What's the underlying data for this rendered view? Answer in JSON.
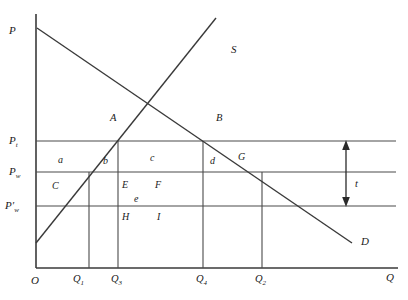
{
  "figure": {
    "type": "economics-tariff-diagram",
    "axes": {
      "y_axis_label": "P",
      "x_axis_label": "Q",
      "origin_label": "O"
    },
    "curves": [
      {
        "name": "demand",
        "label": "D"
      },
      {
        "name": "supply",
        "label": "S"
      }
    ],
    "price_levels": [
      {
        "id": "pt",
        "base": "P",
        "sub": "t",
        "prime": false
      },
      {
        "id": "pw",
        "base": "P",
        "sub": "w",
        "prime": false
      },
      {
        "id": "pwp",
        "base": "P",
        "sub": "w",
        "prime": true
      }
    ],
    "quantities": [
      {
        "id": "q1",
        "base": "Q",
        "sub": "1"
      },
      {
        "id": "q3",
        "base": "Q",
        "sub": "3"
      },
      {
        "id": "q4",
        "base": "Q",
        "sub": "4"
      },
      {
        "id": "q2",
        "base": "Q",
        "sub": "2"
      }
    ],
    "points": [
      {
        "id": "a",
        "label": "A"
      },
      {
        "id": "b",
        "label": "B"
      }
    ],
    "regions": [
      {
        "id": "a_low",
        "label": "a"
      },
      {
        "id": "b_low",
        "label": "b"
      },
      {
        "id": "c_low",
        "label": "c"
      },
      {
        "id": "d_low",
        "label": "d"
      },
      {
        "id": "g_up",
        "label": "G"
      },
      {
        "id": "c_up",
        "label": "C"
      },
      {
        "id": "e_up",
        "label": "E"
      },
      {
        "id": "f_up",
        "label": "F"
      },
      {
        "id": "e_low",
        "label": "e"
      },
      {
        "id": "h_up",
        "label": "H"
      },
      {
        "id": "i_up",
        "label": "I"
      }
    ],
    "annotations": [
      {
        "id": "tariff",
        "label": "t",
        "description": "tariff-gap-arrow"
      }
    ],
    "colors": {
      "line": "#3a3a3a",
      "text": "#1a1a1a",
      "background": "#ffffff"
    }
  }
}
